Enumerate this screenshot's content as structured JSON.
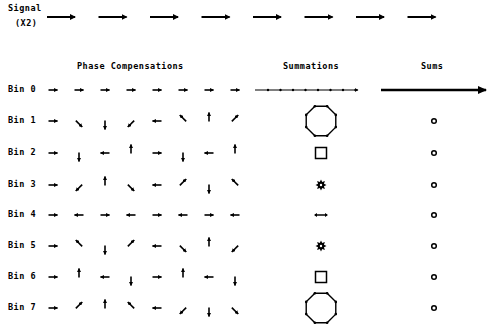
{
  "signal": {
    "label_line1": "Signal",
    "label_line2": "(X2)",
    "arrow_count": 8,
    "arrow_direction": "right"
  },
  "headers": {
    "phase": "Phase Compensations",
    "summations": "Summations",
    "sums": "Sums"
  },
  "bins": [
    {
      "label": "Bin 0",
      "k": 0,
      "summation_shape": "straight-line",
      "sum": "long-arrow"
    },
    {
      "label": "Bin 1",
      "k": 1,
      "summation_shape": "octagon",
      "sum": "small-circle"
    },
    {
      "label": "Bin 2",
      "k": 2,
      "summation_shape": "square",
      "sum": "small-circle"
    },
    {
      "label": "Bin 3",
      "k": 3,
      "summation_shape": "star",
      "sum": "small-circle"
    },
    {
      "label": "Bin 4",
      "k": 4,
      "summation_shape": "back-and-forth",
      "sum": "small-circle"
    },
    {
      "label": "Bin 5",
      "k": 5,
      "summation_shape": "star",
      "sum": "small-circle"
    },
    {
      "label": "Bin 6",
      "k": 6,
      "summation_shape": "square",
      "sum": "small-circle"
    },
    {
      "label": "Bin 7",
      "k": 7,
      "summation_shape": "octagon",
      "sum": "small-circle"
    }
  ],
  "phase_step_degrees": -45,
  "samples_per_bin": 8,
  "colors": {
    "ink": "#000000",
    "background": "#ffffff"
  }
}
